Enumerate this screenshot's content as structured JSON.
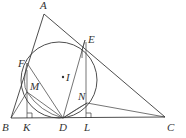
{
  "figure": {
    "stroke_color": "#3a3a3a",
    "label_color": "#333333",
    "points": {
      "A": {
        "label": "A",
        "x": 44,
        "y": 14
      },
      "B": {
        "label": "B",
        "x": 11,
        "y": 118
      },
      "C": {
        "label": "C",
        "x": 165,
        "y": 117
      },
      "D": {
        "label": "D",
        "x": 63,
        "y": 118
      },
      "E": {
        "label": "E",
        "x": 85,
        "y": 40
      },
      "F": {
        "label": "F",
        "x": 27,
        "y": 63
      },
      "I": {
        "label": "I",
        "x": 63,
        "y": 77
      },
      "K": {
        "label": "K",
        "x": 27,
        "y": 118
      },
      "L": {
        "label": "L",
        "x": 86,
        "y": 118
      },
      "M": {
        "label": "M",
        "x": 27,
        "y": 92
      },
      "N": {
        "label": "N",
        "x": 87,
        "y": 103
      }
    },
    "labels": [
      "A",
      "B",
      "C",
      "D",
      "E",
      "F",
      "I",
      "K",
      "L",
      "M",
      "N"
    ]
  }
}
